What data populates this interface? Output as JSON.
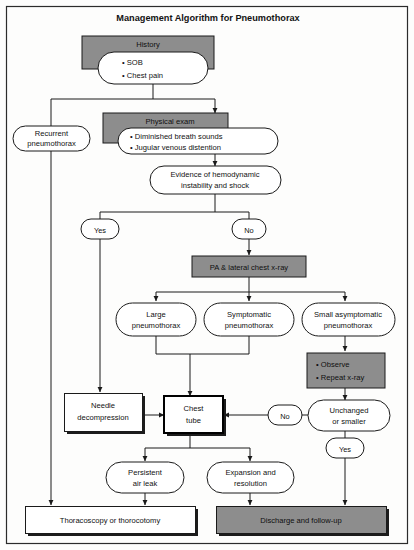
{
  "figure": {
    "title": "Management Algorithm for Pneumothorax",
    "type": "flowchart",
    "domain": "clinical-algorithm"
  },
  "colors": {
    "gray_fill": "#8d8d8d",
    "white_fill": "#ffffff",
    "stroke": "#1a1a1a",
    "page_background": "#fdfdfc",
    "text": "#111111"
  },
  "nodes": {
    "history_header": "History",
    "history_item_1": "• SOB",
    "history_item_2": "• Chest pain",
    "recurrent_line_1": "Recurrent",
    "recurrent_line_2": "pneumothorax",
    "physical_exam_header": "Physical exam",
    "physical_exam_item_1": "• Diminished breath sounds",
    "physical_exam_item_2": "• Jugular venous distention",
    "evidence_line_1": "Evidence of hemodynamic",
    "evidence_line_2": "instability and shock",
    "decision_yes_1": "Yes",
    "decision_no_1": "No",
    "xray": "PA & lateral chest x-ray",
    "large_line_1": "Large",
    "large_line_2": "pneumothorax",
    "symptomatic_line_1": "Symptomatic",
    "symptomatic_line_2": "pneumothorax",
    "small_asymp_line_1": "Small asymptomatic",
    "small_asymp_line_2": "pneumothorax",
    "observe_item_1": "• Observe",
    "observe_item_2": "• Repeat x-ray",
    "needle_line_1": "Needle",
    "needle_line_2": "decompression",
    "chest_tube_line_1": "Chest",
    "chest_tube_line_2": "tube",
    "decision_no_2": "No",
    "unchanged_line_1": "Unchanged",
    "unchanged_line_2": "or smaller",
    "decision_yes_2": "Yes",
    "persistent_line_1": "Persistent",
    "persistent_line_2": "air leak",
    "expansion_line_1": "Expansion and",
    "expansion_line_2": "resolution",
    "thoracoscopy": "Thoracoscopy or thorocotomy",
    "discharge": "Discharge and follow-up"
  },
  "edges": [
    {
      "from": "history",
      "to": "physical_exam",
      "label": ""
    },
    {
      "from": "history",
      "to": "recurrent_pneumothorax",
      "label": ""
    },
    {
      "from": "physical_exam",
      "to": "evidence_of_instability",
      "label": ""
    },
    {
      "from": "evidence_of_instability",
      "to": "yes_1",
      "label": "Yes"
    },
    {
      "from": "evidence_of_instability",
      "to": "no_1",
      "label": "No"
    },
    {
      "from": "yes_1",
      "to": "needle_decompression",
      "label": ""
    },
    {
      "from": "no_1",
      "to": "xray",
      "label": ""
    },
    {
      "from": "xray",
      "to": "large_pneumothorax",
      "label": ""
    },
    {
      "from": "xray",
      "to": "symptomatic_pneumothorax",
      "label": ""
    },
    {
      "from": "xray",
      "to": "small_asymptomatic_pneumothorax",
      "label": ""
    },
    {
      "from": "large_pneumothorax",
      "to": "chest_tube",
      "label": ""
    },
    {
      "from": "symptomatic_pneumothorax",
      "to": "chest_tube",
      "label": ""
    },
    {
      "from": "small_asymptomatic_pneumothorax",
      "to": "observe_repeat",
      "label": ""
    },
    {
      "from": "observe_repeat",
      "to": "unchanged_or_smaller",
      "label": ""
    },
    {
      "from": "unchanged_or_smaller",
      "to": "chest_tube",
      "label": "No"
    },
    {
      "from": "unchanged_or_smaller",
      "to": "discharge",
      "label": "Yes"
    },
    {
      "from": "needle_decompression",
      "to": "chest_tube",
      "label": ""
    },
    {
      "from": "chest_tube",
      "to": "persistent_air_leak",
      "label": ""
    },
    {
      "from": "chest_tube",
      "to": "expansion_and_resolution",
      "label": ""
    },
    {
      "from": "persistent_air_leak",
      "to": "thoracoscopy",
      "label": ""
    },
    {
      "from": "expansion_and_resolution",
      "to": "discharge",
      "label": ""
    },
    {
      "from": "recurrent_pneumothorax",
      "to": "thoracoscopy",
      "label": ""
    }
  ]
}
